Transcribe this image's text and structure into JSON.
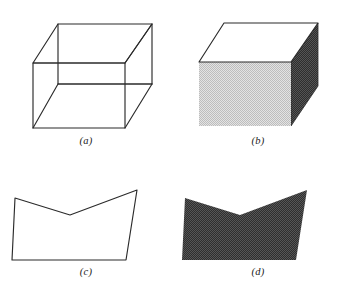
{
  "figure": {
    "caption_style": "italic-parenthetical",
    "background_color": "#ffffff",
    "stroke_color": "#2b2b2b",
    "panel_count": 4,
    "columns": 2,
    "rows": 2
  },
  "panels": [
    {
      "id": "a",
      "label": "(a)",
      "name": "wireframe-cube",
      "description": "Wireframe cube drawn in line-only outline with all twelve edges visible including hidden edges",
      "render_mode": "wireframe",
      "stroke_color": "#2b2b2b",
      "stroke_width": 1,
      "fill_colors": [],
      "vertices": {
        "front_top_left": [
          33,
          61
        ],
        "front_top_right": [
          125,
          61
        ],
        "front_bottom_left": [
          33,
          126
        ],
        "front_bottom_right": [
          125,
          126
        ],
        "back_top_left": [
          58,
          22
        ],
        "back_top_right": [
          152,
          22
        ],
        "back_bottom_left": [
          58,
          82
        ],
        "back_bottom_right": [
          152,
          82
        ]
      }
    },
    {
      "id": "b",
      "label": "(b)",
      "name": "shaded-cube",
      "description": "Same cube rendered as solid faces with flat shading: white top face, light gray front face, dark gray right face",
      "render_mode": "shaded",
      "stroke_color": "#2b2b2b",
      "stroke_width": 1,
      "fill_colors": {
        "top_face": "#ffffff",
        "front_face": "#d2d2d2",
        "right_face": "#3c3c3c"
      }
    },
    {
      "id": "c",
      "label": "(c)",
      "name": "wireframe-bent-polygon",
      "description": "Wireframe outline of a bent quadrilateral surface with a concave V notch along the top edge",
      "render_mode": "wireframe",
      "stroke_color": "#2b2b2b",
      "stroke_width": 1,
      "fill_colors": [],
      "vertices": {
        "top_left": [
          15,
          30
        ],
        "notch_bottom": [
          70,
          47
        ],
        "top_right": [
          137,
          22
        ],
        "bottom_right": [
          126,
          92
        ],
        "bottom_left": [
          12,
          92
        ]
      }
    },
    {
      "id": "d",
      "label": "(d)",
      "name": "shaded-bent-polygon",
      "description": "Same bent polygon rendered as a solid flat-shaded dark gray surface with no outline",
      "render_mode": "shaded",
      "stroke_color": "none",
      "stroke_width": 0,
      "fill_colors": {
        "surface": "#3d3d3d"
      }
    }
  ]
}
